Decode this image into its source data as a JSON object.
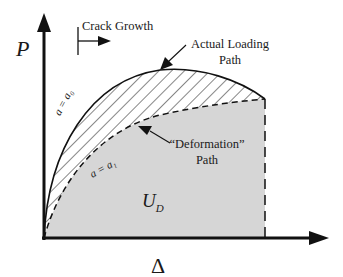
{
  "diagram": {
    "axes": {
      "y_label": "P",
      "x_label": "Δ"
    },
    "annotations": {
      "crack_growth": "Crack Growth",
      "actual_loading_line1": "Actual Loading",
      "actual_loading_line2": "Path",
      "deformation_line1": "“Deformation”",
      "deformation_line2": "Path",
      "area_label_main": "U",
      "area_label_sub": "D",
      "curve_a0": "a = a₀",
      "curve_a1": "a = a₁"
    },
    "colors": {
      "line": "#111111",
      "fill_grey": "#d6d6d6",
      "hatch": "#222222",
      "background": "#ffffff"
    }
  }
}
